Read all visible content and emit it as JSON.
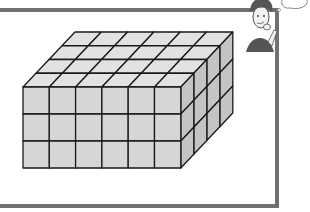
{
  "figure": {
    "type": "rectangular prism built from unit cubes",
    "cubes_wide": 6,
    "cubes_tall": 3,
    "cubes_deep": 4,
    "colors": {
      "front_face": "#d6d6d6",
      "top_face": "#e2e2e2",
      "side_face": "#c4c4c4",
      "edge": "#1a1a1a",
      "frame": "#707070"
    }
  },
  "character": {
    "description": "cartoon boy thinking with hand on chin",
    "thought_bubble": true
  }
}
